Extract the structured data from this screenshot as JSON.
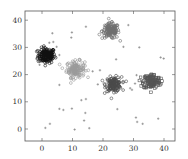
{
  "chart_data": {
    "type": "scatter",
    "title": "",
    "xlabel": "",
    "ylabel": "",
    "xlim": [
      -5,
      43
    ],
    "ylim": [
      -4,
      44
    ],
    "grid": false,
    "x_ticks": [
      0,
      10,
      20,
      30,
      40
    ],
    "y_ticks": [
      0,
      10,
      20,
      30,
      40
    ],
    "legend": null,
    "clusters": [
      {
        "name": "cluster-1",
        "marker": "circle",
        "color": "#111111",
        "center": [
          1.5,
          27
        ],
        "spread": 1.4,
        "count": 160
      },
      {
        "name": "cluster-2",
        "marker": "circle",
        "color": "#9a9a9a",
        "center": [
          11,
          22
        ],
        "spread": 1.5,
        "count": 140
      },
      {
        "name": "cluster-3",
        "marker": "circle",
        "color": "#6e6e6e",
        "center": [
          22.5,
          36
        ],
        "spread": 1.4,
        "count": 140
      },
      {
        "name": "cluster-4",
        "marker": "circle",
        "color": "#4a4a4a",
        "center": [
          23.5,
          16.5
        ],
        "spread": 1.3,
        "count": 140
      },
      {
        "name": "cluster-5",
        "marker": "square",
        "color": "#555555",
        "center": [
          36,
          17.5
        ],
        "spread": 1.4,
        "count": 140
      }
    ],
    "noise": {
      "marker": "plus",
      "color": "#777777",
      "points": [
        [
          3.4,
          35.2
        ],
        [
          9.8,
          35.5
        ],
        [
          9.6,
          33.6
        ],
        [
          14.4,
          37.6
        ],
        [
          28.3,
          38.2
        ],
        [
          3.7,
          32
        ],
        [
          2.4,
          31.7
        ],
        [
          4.8,
          30.2
        ],
        [
          5.7,
          27.2
        ],
        [
          26.7,
          30.2
        ],
        [
          31.9,
          30
        ],
        [
          24.3,
          25.6
        ],
        [
          38.9,
          26.3
        ],
        [
          39.9,
          25.9
        ],
        [
          19,
          21.6
        ],
        [
          16.6,
          21.2
        ],
        [
          18.3,
          16.4
        ],
        [
          5.7,
          16.2
        ],
        [
          31,
          19.8
        ],
        [
          30.5,
          16.7
        ],
        [
          28.9,
          15
        ],
        [
          29.5,
          14.4
        ],
        [
          12.9,
          10.6
        ],
        [
          14.4,
          11
        ],
        [
          5.7,
          7.4
        ],
        [
          7,
          7
        ],
        [
          9.8,
          7.5
        ],
        [
          14.2,
          5.9
        ],
        [
          24.7,
          7.3
        ],
        [
          13.8,
          3.1
        ],
        [
          30.8,
          4.2
        ],
        [
          31.2,
          2.6
        ],
        [
          33,
          1.9
        ],
        [
          38.1,
          3.8
        ],
        [
          2.6,
          1.9
        ],
        [
          1.1,
          0.4
        ],
        [
          10.7,
          -0.2
        ],
        [
          15.5,
          0.3
        ],
        [
          -0.8,
          23.6
        ]
      ]
    }
  }
}
